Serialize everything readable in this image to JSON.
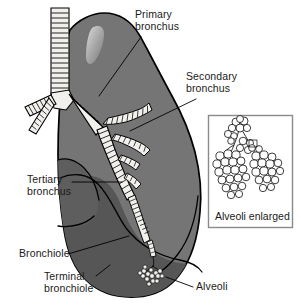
{
  "figure": {
    "background_color": "#ffffff",
    "outline_color": "#000000",
    "lung_fill": "#757575",
    "lung_lobe_dark_fill": "#565656",
    "airway_fill": "#f2f0ec",
    "text_color": "#1a1a1a",
    "leader_line_color": "#000000"
  },
  "labels": {
    "primary_bronchus": "Primary\nbronchus",
    "secondary_bronchus": "Secondary\nbronchus",
    "tertiary_bronchus": "Tertiary\nbronchus",
    "bronchiole": "Bronchiole",
    "terminal_bronchiole": "Terminal\nbronchiole",
    "alveoli": "Alveoli"
  },
  "inset": {
    "caption": "Alveoli enlarged",
    "border_color": "#8a8a8a",
    "fill": "#ffffff"
  }
}
